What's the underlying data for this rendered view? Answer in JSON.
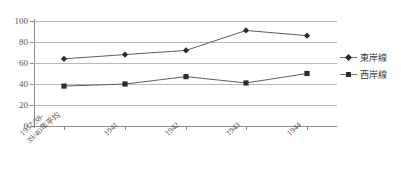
{
  "chart_data": {
    "type": "line",
    "title": "",
    "xlabel": "",
    "ylabel": "",
    "ylim": [
      0,
      100
    ],
    "ytick_labels": [
      "100",
      "80",
      "60",
      "40",
      "20",
      "0"
    ],
    "ytick_values": [
      100,
      80,
      60,
      40,
      20,
      0
    ],
    "grid": true,
    "legend_position": "right",
    "categories": [
      "1937/38-\n39/40年平均",
      "1941",
      "1942",
      "1943",
      "1944"
    ],
    "series": [
      {
        "name": "東岸線",
        "marker": "diamond",
        "color": "#2b2b2b",
        "values": [
          64,
          68,
          72,
          91,
          86
        ]
      },
      {
        "name": "西岸線",
        "marker": "square",
        "color": "#2b2b2b",
        "values": [
          38,
          40,
          47,
          41,
          50
        ]
      }
    ]
  },
  "legend": {
    "items": [
      {
        "label": "東岸線",
        "marker": "diamond"
      },
      {
        "label": "西岸線",
        "marker": "square"
      }
    ]
  }
}
